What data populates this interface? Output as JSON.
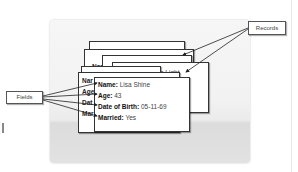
{
  "diagram": {
    "labels": {
      "records": "Records",
      "fields": "Fields"
    },
    "back_card": {
      "name_label": "Name:",
      "name_value": "Darren Light",
      "partial_label": "Nam"
    },
    "front_card": {
      "fields": [
        {
          "label": "Name:",
          "value": "Lisa Shine"
        },
        {
          "label": "Age:",
          "value": "43"
        },
        {
          "label": "Date of Birth:",
          "value": "05-11-69"
        },
        {
          "label": "Married:",
          "value": "Yes"
        }
      ]
    },
    "partial_field_stubs": [
      "Nar",
      "Age",
      "Dat",
      "Mar"
    ],
    "colors": {
      "panel": "#f2f2f2",
      "card": "#ffffff",
      "border": "#333333",
      "arrow": "#222222"
    }
  }
}
